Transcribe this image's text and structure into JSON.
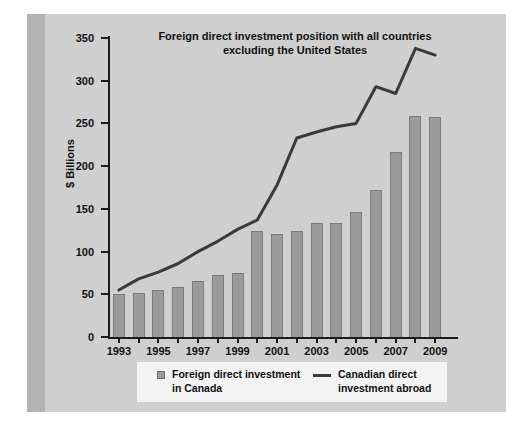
{
  "title": "Foreign direct investment position with all countries\nexcluding the United States",
  "axes": {
    "ylabel": "$ Billions",
    "yticks": [
      "0",
      "50",
      "100",
      "150",
      "200",
      "250",
      "300",
      "350"
    ],
    "xticks": [
      "1993",
      "1995",
      "1997",
      "1999",
      "2001",
      "2003",
      "2005",
      "2007",
      "2009"
    ]
  },
  "legend": {
    "bar_label": "Foreign direct investment\nin Canada",
    "line_label": "Canadian direct\ninvestment abroad"
  },
  "colors": {
    "panel": "#cfcfcf",
    "spine": "#b3b3b3",
    "bar": "#9b9b9b",
    "bar_edge": "#7c7c7c",
    "line": "#3a3a3a",
    "axis": "#1c1c1c",
    "legend_bg": "#f3f3f3",
    "text": "#111111"
  },
  "chart_data": {
    "type": "bar",
    "title": "Foreign direct investment position with all countries excluding the United States",
    "xlabel": "",
    "ylabel": "$ Billions",
    "ylim": [
      0,
      350
    ],
    "ytick_step": 50,
    "grid": false,
    "legend_position": "bottom",
    "categories": [
      "1993",
      "1994",
      "1995",
      "1996",
      "1997",
      "1998",
      "1999",
      "2000",
      "2001",
      "2002",
      "2003",
      "2004",
      "2005",
      "2006",
      "2007",
      "2008",
      "2009"
    ],
    "series": [
      {
        "name": "Foreign direct investment in Canada",
        "type": "bar",
        "values": [
          50,
          52,
          55,
          59,
          65,
          73,
          75,
          124,
          121,
          124,
          134,
          134,
          146,
          172,
          217,
          259,
          257
        ]
      },
      {
        "name": "Canadian direct investment abroad",
        "type": "line",
        "values": [
          55,
          68,
          76,
          86,
          100,
          112,
          126,
          137,
          178,
          233,
          240,
          246,
          250,
          293,
          285,
          338,
          330
        ]
      }
    ]
  }
}
